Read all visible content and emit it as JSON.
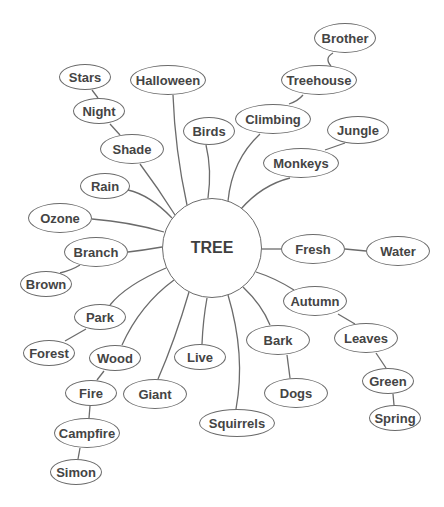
{
  "diagram": {
    "type": "mind-map",
    "colors": {
      "stroke": "#6b6b6b",
      "text": "#444444",
      "background": "#ffffff"
    },
    "center": {
      "id": "tree",
      "label": "TREE",
      "x": 212,
      "y": 248,
      "r": 50
    },
    "nodes": [
      {
        "id": "stars",
        "label": "Stars",
        "x": 85,
        "y": 77,
        "w": 52,
        "h": 26
      },
      {
        "id": "night",
        "label": "Night",
        "x": 99,
        "y": 111,
        "w": 52,
        "h": 26
      },
      {
        "id": "shade",
        "label": "Shade",
        "x": 132,
        "y": 149,
        "w": 64,
        "h": 30
      },
      {
        "id": "halloween",
        "label": "Halloween",
        "x": 168,
        "y": 80,
        "w": 76,
        "h": 30
      },
      {
        "id": "birds",
        "label": "Birds",
        "x": 209,
        "y": 131,
        "w": 52,
        "h": 28
      },
      {
        "id": "brother",
        "label": "Brother",
        "x": 345,
        "y": 38,
        "w": 62,
        "h": 30
      },
      {
        "id": "treehouse",
        "label": "Treehouse",
        "x": 319,
        "y": 80,
        "w": 76,
        "h": 30
      },
      {
        "id": "climbing",
        "label": "Climbing",
        "x": 273,
        "y": 119,
        "w": 76,
        "h": 30
      },
      {
        "id": "jungle",
        "label": "Jungle",
        "x": 358,
        "y": 130,
        "w": 62,
        "h": 28
      },
      {
        "id": "monkeys",
        "label": "Monkeys",
        "x": 301,
        "y": 163,
        "w": 76,
        "h": 30
      },
      {
        "id": "rain",
        "label": "Rain",
        "x": 105,
        "y": 186,
        "w": 50,
        "h": 26
      },
      {
        "id": "ozone",
        "label": "Ozone",
        "x": 60,
        "y": 218,
        "w": 64,
        "h": 30
      },
      {
        "id": "branch",
        "label": "Branch",
        "x": 96,
        "y": 252,
        "w": 64,
        "h": 30
      },
      {
        "id": "brown",
        "label": "Brown",
        "x": 46,
        "y": 284,
        "w": 52,
        "h": 26
      },
      {
        "id": "fresh",
        "label": "Fresh",
        "x": 313,
        "y": 249,
        "w": 64,
        "h": 30
      },
      {
        "id": "water",
        "label": "Water",
        "x": 398,
        "y": 251,
        "w": 64,
        "h": 30
      },
      {
        "id": "autumn",
        "label": "Autumn",
        "x": 315,
        "y": 301,
        "w": 64,
        "h": 30
      },
      {
        "id": "leaves",
        "label": "Leaves",
        "x": 366,
        "y": 338,
        "w": 64,
        "h": 30
      },
      {
        "id": "green",
        "label": "Green",
        "x": 388,
        "y": 381,
        "w": 52,
        "h": 26
      },
      {
        "id": "spring",
        "label": "Spring",
        "x": 395,
        "y": 418,
        "w": 52,
        "h": 26
      },
      {
        "id": "bark",
        "label": "Bark",
        "x": 278,
        "y": 340,
        "w": 64,
        "h": 30
      },
      {
        "id": "dogs",
        "label": "Dogs",
        "x": 296,
        "y": 393,
        "w": 64,
        "h": 30
      },
      {
        "id": "squirrels",
        "label": "Squirrels",
        "x": 237,
        "y": 423,
        "w": 76,
        "h": 28
      },
      {
        "id": "live",
        "label": "Live",
        "x": 200,
        "y": 357,
        "w": 52,
        "h": 26
      },
      {
        "id": "giant",
        "label": "Giant",
        "x": 155,
        "y": 394,
        "w": 64,
        "h": 30
      },
      {
        "id": "wood",
        "label": "Wood",
        "x": 115,
        "y": 358,
        "w": 52,
        "h": 26
      },
      {
        "id": "fire",
        "label": "Fire",
        "x": 91,
        "y": 393,
        "w": 52,
        "h": 26
      },
      {
        "id": "campfire",
        "label": "Campfire",
        "x": 87,
        "y": 433,
        "w": 66,
        "h": 30
      },
      {
        "id": "simon",
        "label": "Simon",
        "x": 76,
        "y": 472,
        "w": 52,
        "h": 26
      },
      {
        "id": "park",
        "label": "Park",
        "x": 100,
        "y": 317,
        "w": 52,
        "h": 26
      },
      {
        "id": "forest",
        "label": "Forest",
        "x": 49,
        "y": 353,
        "w": 52,
        "h": 26
      }
    ],
    "edges": [
      {
        "from": "tree",
        "to": "shade",
        "d": "M175,215 Q158,188 140,164"
      },
      {
        "from": "tree",
        "to": "halloween",
        "d": "M187,205 Q175,150 173,95"
      },
      {
        "from": "tree",
        "to": "birds",
        "d": "M208,198 Q212,170 206,145"
      },
      {
        "from": "tree",
        "to": "climbing",
        "d": "M228,201 Q232,160 260,134"
      },
      {
        "from": "tree",
        "to": "monkeys",
        "d": "M241,209 Q262,185 290,178"
      },
      {
        "from": "tree",
        "to": "rain",
        "d": "M172,218 Q150,195 128,190"
      },
      {
        "from": "tree",
        "to": "ozone",
        "d": "M164,232 Q130,222 92,219"
      },
      {
        "from": "tree",
        "to": "branch",
        "d": "M162,247 Q145,250 128,252"
      },
      {
        "from": "tree",
        "to": "fresh",
        "d": "M262,249 L281,249"
      },
      {
        "from": "tree",
        "to": "autumn",
        "d": "M256,272 Q275,278 294,290"
      },
      {
        "from": "tree",
        "to": "bark",
        "d": "M243,287 Q262,305 270,325"
      },
      {
        "from": "tree",
        "to": "squirrels",
        "d": "M228,295 Q246,355 236,409"
      },
      {
        "from": "tree",
        "to": "live",
        "d": "M207,298 Q203,320 202,344"
      },
      {
        "from": "tree",
        "to": "giant",
        "d": "M189,292 Q175,340 158,379"
      },
      {
        "from": "tree",
        "to": "wood",
        "d": "M174,280 Q140,305 122,345"
      },
      {
        "from": "tree",
        "to": "park",
        "d": "M166,268 Q126,285 110,305"
      },
      {
        "from": "stars",
        "to": "night",
        "d": "M92,90 L98,98"
      },
      {
        "from": "night",
        "to": "shade",
        "d": "M110,124 L120,135"
      },
      {
        "from": "brother",
        "to": "treehouse",
        "d": "M333,53 Q324,58 331,66"
      },
      {
        "from": "treehouse",
        "to": "climbing",
        "d": "M303,95 Q298,101 289,104"
      },
      {
        "from": "jungle",
        "to": "monkeys",
        "d": "M345,143 L325,150"
      },
      {
        "from": "branch",
        "to": "brown",
        "d": "M80,265 Q72,270 60,273"
      },
      {
        "from": "fresh",
        "to": "water",
        "d": "M345,249 L366,251"
      },
      {
        "from": "autumn",
        "to": "leaves",
        "d": "M338,314 L355,324"
      },
      {
        "from": "leaves",
        "to": "green",
        "d": "M376,353 L386,368"
      },
      {
        "from": "green",
        "to": "spring",
        "d": "M393,394 L394,405"
      },
      {
        "from": "bark",
        "to": "dogs",
        "d": "M287,355 L290,378"
      },
      {
        "from": "wood",
        "to": "fire",
        "d": "M104,371 L97,380"
      },
      {
        "from": "fire",
        "to": "campfire",
        "d": "M90,406 L89,418"
      },
      {
        "from": "campfire",
        "to": "simon",
        "d": "M80,448 L78,459"
      },
      {
        "from": "park",
        "to": "forest",
        "d": "M86,329 L65,341"
      }
    ]
  }
}
